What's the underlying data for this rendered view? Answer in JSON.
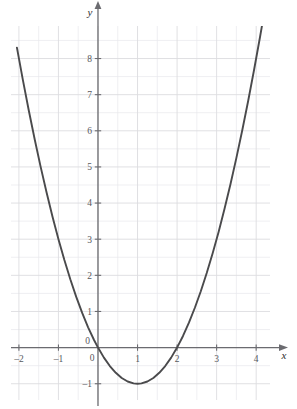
{
  "figure": {
    "background_color": "#ffffff",
    "grid_color": "#dcdce0",
    "grid_minor_color": "#e8e8ec",
    "axis_color": "#6b6b70",
    "curve_color": "#4a4a4c",
    "label_color": "#58585c"
  },
  "axes": {
    "x_axis_name": "x",
    "y_axis_name": "y",
    "origin_label_x": "0",
    "origin_label_y": "0"
  },
  "chart_data": {
    "type": "line",
    "title": "",
    "subtitle": "",
    "xlabel": "x",
    "ylabel": "y",
    "xlim": [
      -2.2,
      4.35
    ],
    "ylim": [
      -1.45,
      8.9
    ],
    "xticks": [
      -2,
      -1,
      0,
      1,
      2,
      3,
      4
    ],
    "xtick_labels": [
      "-2",
      "-1",
      "0",
      "1",
      "2",
      "3",
      "4"
    ],
    "yticks": [
      -1,
      0,
      1,
      2,
      3,
      4,
      5,
      6,
      7,
      8
    ],
    "ytick_labels": [
      "-1",
      "0",
      "1",
      "2",
      "3",
      "4",
      "5",
      "6",
      "7",
      "8"
    ],
    "grid": true,
    "grid_major_step": 1,
    "grid_minor_step": 0.5,
    "legend": null,
    "legend_position": "none",
    "annotations": [],
    "series": [
      {
        "name": "y = x^2 - 2x",
        "equation": "y = x^2 - 2x",
        "vertex": [
          1,
          -1
        ],
        "roots": [
          0,
          2
        ],
        "x": [
          -2.05,
          -1.9,
          -1.75,
          -1.6,
          -1.45,
          -1.3,
          -1.15,
          -1,
          -0.85,
          -0.7,
          -0.55,
          -0.4,
          -0.25,
          -0.1,
          0,
          0.15,
          0.3,
          0.45,
          0.6,
          0.75,
          0.9,
          1,
          1.1,
          1.25,
          1.4,
          1.55,
          1.7,
          1.85,
          2,
          2.15,
          2.3,
          2.45,
          2.6,
          2.75,
          2.9,
          3.05,
          3.2,
          3.35,
          3.5,
          3.65,
          3.8,
          3.95,
          4.1,
          4.2
        ],
        "values": [
          8.3,
          7.41,
          6.5625,
          5.76,
          5.0025,
          4.29,
          3.6225,
          3,
          2.4225,
          1.89,
          1.4025,
          0.96,
          0.5625,
          0.21,
          0,
          -0.2775,
          -0.51,
          -0.6975,
          -0.84,
          -0.9375,
          -0.99,
          -1,
          -0.99,
          -0.9375,
          -0.84,
          -0.6975,
          -0.51,
          -0.2775,
          0,
          0.3225,
          0.69,
          1.1025,
          1.56,
          2.0625,
          2.61,
          3.2025,
          3.84,
          4.5225,
          5.25,
          6.0225,
          6.84,
          7.7025,
          8.61,
          9.24
        ]
      }
    ]
  }
}
